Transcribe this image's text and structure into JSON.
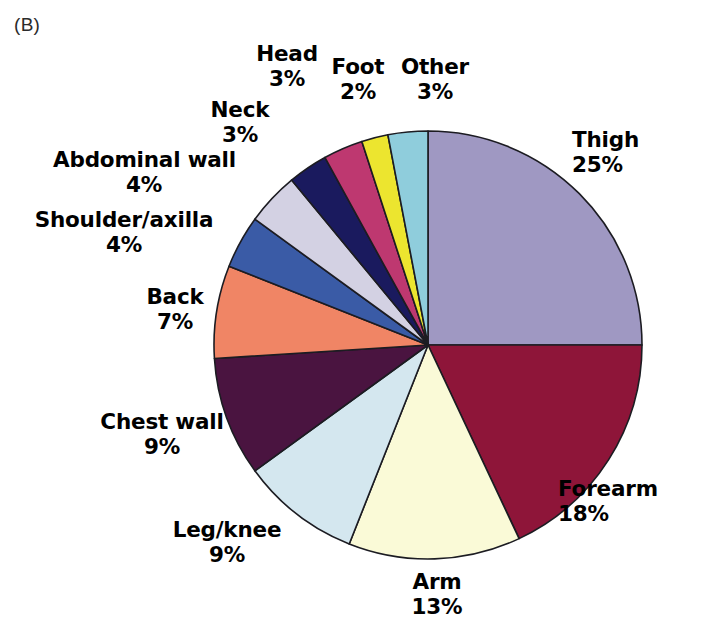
{
  "figure": {
    "panel_letter": "(B)"
  },
  "chart_data": {
    "type": "pie",
    "title": "",
    "subtitle": "",
    "xlabel": "",
    "ylabel": "",
    "legend_position": "none",
    "grid": false,
    "start_angle_deg": 0,
    "direction": "clockwise",
    "units": "percent",
    "total": 100,
    "categories": [
      "Thigh",
      "Forearm",
      "Arm",
      "Leg/knee",
      "Chest wall",
      "Back",
      "Shoulder/axilla",
      "Abdominal wall",
      "Neck",
      "Head",
      "Foot",
      "Other"
    ],
    "values": [
      25,
      18,
      13,
      9,
      9,
      7,
      4,
      4,
      3,
      3,
      2,
      3
    ],
    "colors": [
      "#9f98c2",
      "#8e1539",
      "#fafad7",
      "#d4e7ef",
      "#4a1440",
      "#f08565",
      "#3a5ba6",
      "#d3d1e3",
      "#1a1a5e",
      "#be3870",
      "#ece52f",
      "#8fcddc"
    ],
    "slices": [
      {
        "label": "Thigh",
        "value": 25,
        "pct_text": "25%",
        "color": "#9f98c2"
      },
      {
        "label": "Forearm",
        "value": 18,
        "pct_text": "18%",
        "color": "#8e1539"
      },
      {
        "label": "Arm",
        "value": 13,
        "pct_text": "13%",
        "color": "#fafad7"
      },
      {
        "label": "Leg/knee",
        "value": 9,
        "pct_text": "9%",
        "color": "#d4e7ef"
      },
      {
        "label": "Chest wall",
        "value": 9,
        "pct_text": "9%",
        "color": "#4a1440"
      },
      {
        "label": "Back",
        "value": 7,
        "pct_text": "7%",
        "color": "#f08565"
      },
      {
        "label": "Shoulder/axilla",
        "value": 4,
        "pct_text": "4%",
        "color": "#3a5ba6"
      },
      {
        "label": "Abdominal wall",
        "value": 4,
        "pct_text": "4%",
        "color": "#d3d1e3"
      },
      {
        "label": "Neck",
        "value": 3,
        "pct_text": "3%",
        "color": "#1a1a5e"
      },
      {
        "label": "Head",
        "value": 3,
        "pct_text": "3%",
        "color": "#be3870"
      },
      {
        "label": "Foot",
        "value": 2,
        "pct_text": "2%",
        "color": "#ece52f"
      },
      {
        "label": "Other",
        "value": 3,
        "pct_text": "3%",
        "color": "#8fcddc"
      }
    ]
  },
  "labels": {
    "thigh": {
      "name": "Thigh",
      "pct": "25%"
    },
    "forearm": {
      "name": "Forearm",
      "pct": "18%"
    },
    "arm": {
      "name": "Arm",
      "pct": "13%"
    },
    "leg_knee": {
      "name": "Leg/knee",
      "pct": "9%"
    },
    "chest_wall": {
      "name": "Chest wall",
      "pct": "9%"
    },
    "back": {
      "name": "Back",
      "pct": "7%"
    },
    "shoulder_axilla": {
      "name": "Shoulder/axilla",
      "pct": "4%"
    },
    "abdominal_wall": {
      "name": "Abdominal wall",
      "pct": "4%"
    },
    "neck": {
      "name": "Neck",
      "pct": "3%"
    },
    "head": {
      "name": "Head",
      "pct": "3%"
    },
    "foot": {
      "name": "Foot",
      "pct": "2%"
    },
    "other": {
      "name": "Other",
      "pct": "3%"
    }
  },
  "style": {
    "slice_stroke": "#1c1c22",
    "background": "#ffffff",
    "text_color": "#000000"
  }
}
